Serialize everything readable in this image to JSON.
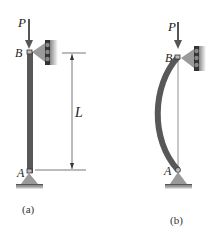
{
  "figure": {
    "panel_a": {
      "load_label": "P",
      "top_label": "B",
      "bottom_label": "A",
      "length_label": "L",
      "caption": "(a)"
    },
    "panel_b": {
      "load_label": "P",
      "top_label": "B",
      "bottom_label": "A",
      "caption": "(b)"
    },
    "colors": {
      "column": "#585858",
      "support": "#9a9a9a",
      "line": "#555555"
    }
  }
}
